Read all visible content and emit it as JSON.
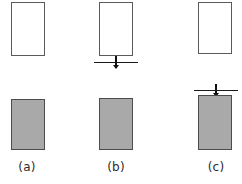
{
  "figure": {
    "title": "",
    "background_color": "#ffffff",
    "outline_color": "#5a5a5a",
    "fill_color": "#a9a9a9",
    "marker_color": "#111111",
    "columns": [
      {
        "id": "a",
        "caption": "(a)",
        "caption_center_x": 27,
        "open_rect": {
          "x": 11,
          "y": 2,
          "width": 34,
          "height": 54
        },
        "filled_rect": {
          "x": 11,
          "y": 99,
          "width": 34,
          "height": 51
        },
        "marker": null
      },
      {
        "id": "b",
        "caption": "(b)",
        "caption_center_x": 116,
        "open_rect": {
          "x": 99,
          "y": 2,
          "width": 34,
          "height": 54
        },
        "filled_rect": {
          "x": 99,
          "y": 98,
          "width": 34,
          "height": 52
        },
        "marker": {
          "x": 94,
          "y": 56,
          "width": 44,
          "position": "below-open-rect"
        }
      },
      {
        "id": "c",
        "caption": "(c)",
        "caption_center_x": 216,
        "open_rect": {
          "x": 198,
          "y": 2,
          "width": 34,
          "height": 52
        },
        "filled_rect": {
          "x": 198,
          "y": 95,
          "width": 34,
          "height": 55
        },
        "marker": {
          "x": 194,
          "y": 84,
          "width": 44,
          "position": "above-filled-rect"
        }
      }
    ]
  }
}
